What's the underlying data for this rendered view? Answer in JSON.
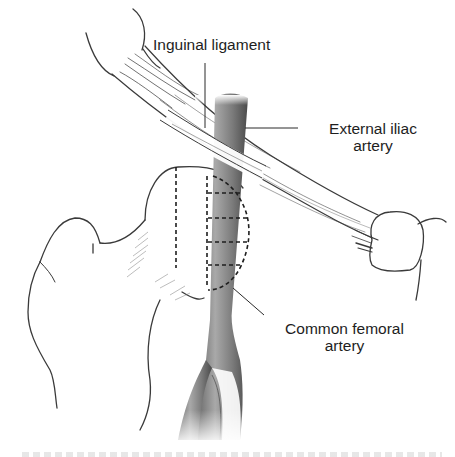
{
  "figure": {
    "type": "anatomical line drawing",
    "colors": {
      "line": "#3a3a3a",
      "artery_dark": "#4a4a4a",
      "artery_light": "#b8b8b8",
      "text": "#1e1e1e",
      "background": "#ffffff"
    }
  },
  "labels": {
    "inguinal_ligament": "Inguinal ligament",
    "external_iliac_line1": "External iliac",
    "external_iliac_line2": "artery",
    "common_femoral_line1": "Common femoral",
    "common_femoral_line2": "artery"
  },
  "caption": {
    "visible": "partially cut off (illegible)"
  }
}
